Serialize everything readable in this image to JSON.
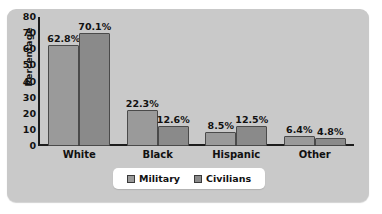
{
  "chart_data": {
    "type": "bar",
    "title": "",
    "xlabel": "",
    "ylabel": "Percentage",
    "ylim": [
      0,
      80
    ],
    "yticks": [
      "80",
      "70",
      "60",
      "50",
      "40",
      "30",
      "20",
      "10",
      "0"
    ],
    "grid": false,
    "legend_position": "bottom",
    "categories": [
      "White",
      "Black",
      "Hispanic",
      "Other"
    ],
    "series": [
      {
        "name": "Military",
        "values": [
          62.8,
          22.3,
          8.5,
          6.4
        ],
        "labels": [
          "62.8%",
          "22.3%",
          "8.5%",
          "6.4%"
        ],
        "color": "#9a9a9a"
      },
      {
        "name": "Civilians",
        "values": [
          70.1,
          12.6,
          12.5,
          4.8
        ],
        "labels": [
          "70.1%",
          "12.6%",
          "12.5%",
          "4.8%"
        ],
        "color": "#8a8a8a"
      }
    ]
  },
  "legend": {
    "items": [
      {
        "label": "Military"
      },
      {
        "label": "Civilians"
      }
    ]
  },
  "colors": {
    "panel_background": "#c9c9c9",
    "page_background": "#ffffff",
    "axis": "#1c1c1c",
    "text": "#111111",
    "legend_background": "#ffffff"
  }
}
